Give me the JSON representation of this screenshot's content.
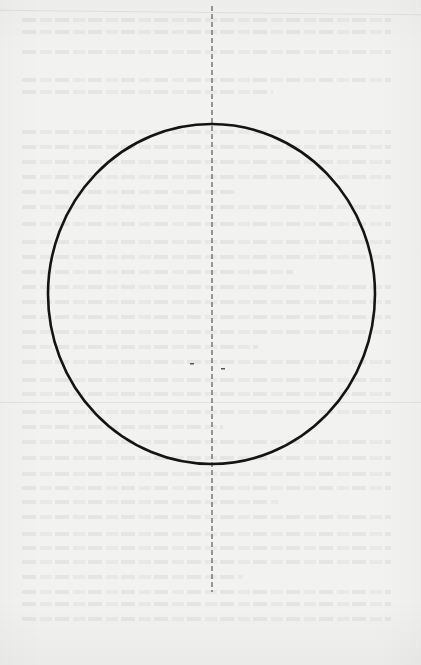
{
  "page": {
    "width": 421,
    "height": 665,
    "background": "#f2f2f0",
    "ink_color": "#141414"
  },
  "figure": {
    "type": "geometric-diagram",
    "ellipse": {
      "cx": 211.5,
      "cy": 294,
      "rx": 163.5,
      "ry": 170,
      "stroke": "#141414",
      "stroke_width": 2.6
    },
    "axis": {
      "x": 212,
      "y1": 6,
      "y2": 592,
      "stroke": "#3a3a3a",
      "stroke_width": 1,
      "dash": "5 3"
    },
    "specks": [
      {
        "x": 192,
        "y": 364
      },
      {
        "x": 223,
        "y": 369
      }
    ]
  },
  "bleed_through_lines_y": [
    18,
    30,
    50,
    78,
    90,
    130,
    145,
    160,
    175,
    190,
    205,
    222,
    240,
    255,
    270,
    285,
    300,
    315,
    330,
    345,
    360,
    378,
    392,
    410,
    425,
    440,
    456,
    472,
    486,
    500,
    515,
    532,
    546,
    560,
    575,
    590,
    602,
    617
  ]
}
